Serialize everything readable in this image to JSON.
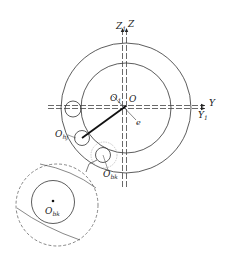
{
  "diagram": {
    "type": "geometric-schematic",
    "colors": {
      "stroke": "#333333",
      "thin": "#555555",
      "dashed": "#444444",
      "light": "#999999",
      "background": "#ffffff"
    },
    "axes": {
      "z": {
        "label": "Z",
        "sub": ""
      },
      "z1": {
        "label": "Z",
        "sub": "1"
      },
      "y": {
        "label": "Y",
        "sub": ""
      },
      "y1": {
        "label": "Y",
        "sub": "1"
      }
    },
    "points": {
      "o": {
        "label": "O",
        "sub": ""
      },
      "o1": {
        "label": "O",
        "sub": "1"
      },
      "e": {
        "label": "e",
        "sub": ""
      },
      "ohj": {
        "label": "O",
        "sub": "hj"
      },
      "obk": {
        "label": "O",
        "sub": "bk"
      },
      "obk_detail": {
        "label": "O",
        "sub": "bk"
      }
    },
    "shapes": {
      "outer_circle": {
        "cx": 126,
        "cy": 108,
        "r": 65
      },
      "inner_circle": {
        "cx": 126,
        "cy": 108,
        "r": 45
      },
      "ball_left": {
        "cx": 73,
        "cy": 109,
        "r": 8
      },
      "ball_hj": {
        "cx": 82,
        "cy": 138,
        "r": 7.5
      },
      "ball_bk": {
        "cx": 103,
        "cy": 155,
        "r": 7.5
      },
      "ball_bk_halo": {
        "cx": 104,
        "cy": 155,
        "r": 13
      },
      "detail_dashed_circle": {
        "cx": 57,
        "cy": 205,
        "r": 41
      },
      "detail_ball": {
        "cx": 53,
        "cy": 202,
        "r": 21.5
      }
    }
  }
}
